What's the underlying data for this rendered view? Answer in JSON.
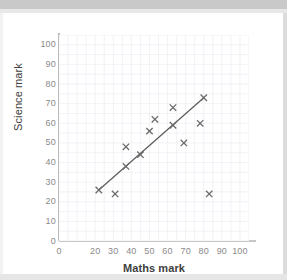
{
  "chart_data": {
    "type": "scatter",
    "title": "",
    "xlabel": "Maths mark",
    "ylabel": "Science mark",
    "xlim": [
      0,
      105
    ],
    "ylim": [
      0,
      105
    ],
    "grid": true,
    "legend": null,
    "xticks": [
      "0",
      "",
      "20",
      "30",
      "40",
      "50",
      "60",
      "70",
      "80",
      "90",
      "100"
    ],
    "xtick_values": [
      0,
      10,
      20,
      30,
      40,
      50,
      60,
      70,
      80,
      90,
      100
    ],
    "yticks": [
      "0",
      "10",
      "20",
      "30",
      "40",
      "50",
      "60",
      "70",
      "80",
      "90",
      "100"
    ],
    "ytick_values": [
      0,
      10,
      20,
      30,
      40,
      50,
      60,
      70,
      80,
      90,
      100
    ],
    "marker": "x",
    "marker_color": "#6b6b6b",
    "points": [
      {
        "x": 22,
        "y": 26
      },
      {
        "x": 31,
        "y": 24
      },
      {
        "x": 37,
        "y": 38
      },
      {
        "x": 37,
        "y": 48
      },
      {
        "x": 45,
        "y": 44
      },
      {
        "x": 50,
        "y": 56
      },
      {
        "x": 53,
        "y": 62
      },
      {
        "x": 63,
        "y": 59
      },
      {
        "x": 63,
        "y": 68
      },
      {
        "x": 69,
        "y": 50
      },
      {
        "x": 78,
        "y": 60
      },
      {
        "x": 80,
        "y": 73
      },
      {
        "x": 83,
        "y": 24
      }
    ],
    "trend_line": {
      "name": "line of best fit",
      "x0": 22,
      "y0": 26,
      "x1": 80,
      "y1": 73,
      "color": "#5a5a5a"
    }
  },
  "colors": {
    "axis": "#808080",
    "grid": "#ececf4",
    "tick_text": "#8a8a8a",
    "axis_label": "#404040",
    "page_band": "#c9c9c9"
  }
}
